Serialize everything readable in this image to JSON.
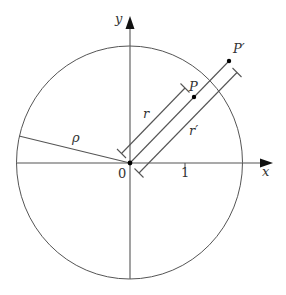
{
  "diagram": {
    "axes": {
      "x_label": "x",
      "y_label": "y",
      "origin_label": "0",
      "tick_x_label": "1"
    },
    "circle_label": "ρ",
    "points": [
      {
        "name": "P",
        "label": "P"
      },
      {
        "name": "P-prime",
        "label": "P′"
      }
    ],
    "distances": [
      {
        "name": "r",
        "label": "r"
      },
      {
        "name": "r-prime",
        "label": "r′"
      }
    ],
    "colors": {
      "stroke": "#555555",
      "text": "#333333",
      "point": "#000000"
    }
  }
}
